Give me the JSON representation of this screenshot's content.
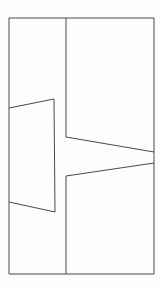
{
  "figure": {
    "width": 163,
    "height": 284,
    "background_color": "#fdfdfd",
    "stroke_color": "#4a4a4a",
    "stroke_width": 1,
    "fill": "none",
    "shapes": [
      {
        "name": "outer-rectangle",
        "kind": "polygon",
        "closed": true,
        "points": [
          [
            9,
            18
          ],
          [
            154,
            18
          ],
          [
            154,
            274
          ],
          [
            9,
            274
          ]
        ]
      },
      {
        "name": "vertical-divider-upper",
        "kind": "polyline",
        "closed": false,
        "points": [
          [
            66,
            18
          ],
          [
            66,
            137
          ]
        ]
      },
      {
        "name": "vertical-divider-lower",
        "kind": "polyline",
        "closed": false,
        "points": [
          [
            66,
            176
          ],
          [
            66,
            274
          ]
        ]
      },
      {
        "name": "upper-diagonal",
        "kind": "polyline",
        "closed": false,
        "points": [
          [
            66,
            137
          ],
          [
            154,
            152
          ]
        ]
      },
      {
        "name": "lower-diagonal",
        "kind": "polyline",
        "closed": false,
        "points": [
          [
            66,
            176
          ],
          [
            154,
            163
          ]
        ]
      },
      {
        "name": "left-inset-quadrilateral",
        "kind": "polyline",
        "closed": false,
        "points": [
          [
            9,
            108
          ],
          [
            54,
            99
          ],
          [
            55,
            212
          ],
          [
            9,
            202
          ]
        ]
      }
    ]
  }
}
